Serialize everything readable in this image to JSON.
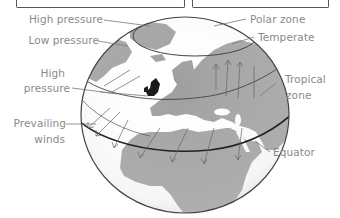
{
  "diagram": {
    "labels": {
      "high_pressure_top": "High pressure",
      "low_pressure": "Low pressure",
      "high_pressure_mid_1": "High",
      "high_pressure_mid_2": "pressure",
      "prevailing_winds_1": "Prevailing",
      "prevailing_winds_2": "winds",
      "polar_zone": "Polar zone",
      "temperate": "Temperate",
      "tropical_zone_1": "Tropical",
      "tropical_zone_2": "zone",
      "equator": "Equator"
    },
    "colors": {
      "land": "#9e9e9e",
      "ocean": "#ffffff",
      "outline": "#444444",
      "label_text": "#8a8a8a",
      "highlight_uk": "#111111"
    }
  }
}
